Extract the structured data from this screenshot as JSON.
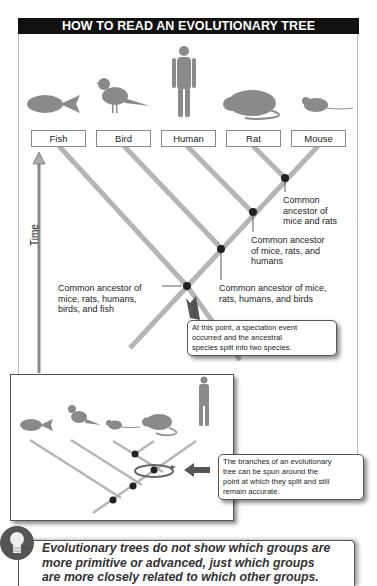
{
  "title": "HOW TO READ AN EVOLUTIONARY TREE",
  "taxa": [
    {
      "label": "Fish",
      "icon": "fish-icon"
    },
    {
      "label": "Bird",
      "icon": "bird-icon"
    },
    {
      "label": "Human",
      "icon": "human-icon"
    },
    {
      "label": "Rat",
      "icon": "rat-icon"
    },
    {
      "label": "Mouse",
      "icon": "mouse-icon"
    }
  ],
  "axis": {
    "label": "Time",
    "direction": "up"
  },
  "nodes": [
    {
      "id": "mice-rats",
      "text_lines": [
        "Common",
        "ancestor of",
        "mice and rats"
      ]
    },
    {
      "id": "mice-rats-humans",
      "text_lines": [
        "Common ancestor",
        "of mice, rats, and",
        "humans"
      ]
    },
    {
      "id": "mice-rats-humans-birds",
      "text_lines": [
        "Common ancestor of mice,",
        "rats, humans, and birds"
      ]
    },
    {
      "id": "all",
      "text_lines": [
        "Common ancestor of",
        "mice, rats, humans,",
        "birds, and fish"
      ]
    }
  ],
  "callouts": {
    "speciation": [
      "At this point, a speciation event",
      "occurred and the ancestral",
      "species split into two species."
    ],
    "rotation": [
      "The branches of an evolutionary",
      "tree can be spun around the",
      "point at which they split and still",
      "remain accurate."
    ]
  },
  "rotated_tree": {
    "taxa_order": [
      "Fish",
      "Bird",
      "Mouse",
      "Rat",
      "Human"
    ]
  },
  "tip": {
    "icon": "lightbulb-icon",
    "lines": [
      "Evolutionary trees do not show which groups are",
      "more primitive or advanced, just which groups",
      "are more closely related to which other groups."
    ]
  },
  "colors": {
    "header_bg": "#111111",
    "branch": "#b5b5b5",
    "node": "#222222",
    "arrow": "#777777"
  }
}
